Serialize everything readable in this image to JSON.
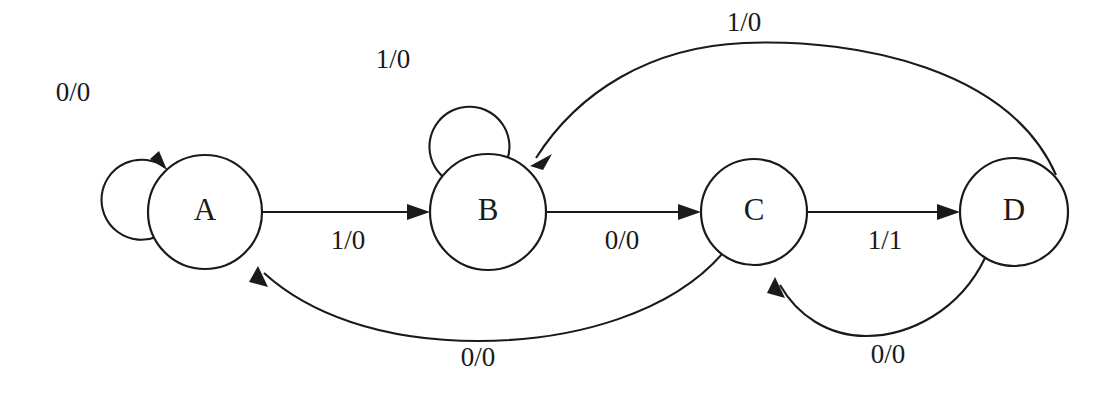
{
  "diagram": {
    "type": "finite-state-machine",
    "label_format": "input/output",
    "stroke_color": "#1a1a1a",
    "background_color": "#ffffff",
    "states": [
      {
        "id": "A",
        "label": "A",
        "cx": 205,
        "cy": 212,
        "r": 57
      },
      {
        "id": "B",
        "label": "B",
        "cx": 488,
        "cy": 212,
        "r": 58
      },
      {
        "id": "C",
        "label": "C",
        "cx": 754,
        "cy": 212,
        "r": 53
      },
      {
        "id": "D",
        "label": "D",
        "cx": 1014,
        "cy": 212,
        "r": 54
      }
    ],
    "transitions": [
      {
        "id": "a-self",
        "from": "A",
        "to": "A",
        "label": "0/0",
        "label_x": 73,
        "label_y": 95,
        "kind": "self-loop"
      },
      {
        "id": "a-to-b",
        "from": "A",
        "to": "B",
        "label": "1/0",
        "label_x": 348,
        "label_y": 243,
        "kind": "straight"
      },
      {
        "id": "b-self",
        "from": "B",
        "to": "B",
        "label": "1/0",
        "label_x": 393,
        "label_y": 62,
        "kind": "self-loop"
      },
      {
        "id": "b-to-c",
        "from": "B",
        "to": "C",
        "label": "0/0",
        "label_x": 622,
        "label_y": 243,
        "kind": "straight"
      },
      {
        "id": "c-to-d",
        "from": "C",
        "to": "D",
        "label": "1/1",
        "label_x": 885,
        "label_y": 243,
        "kind": "straight"
      },
      {
        "id": "d-to-b",
        "from": "D",
        "to": "B",
        "label": "1/0",
        "label_x": 744,
        "label_y": 25,
        "kind": "arc-top"
      },
      {
        "id": "c-to-a",
        "from": "C",
        "to": "A",
        "label": "0/0",
        "label_x": 478,
        "label_y": 360,
        "kind": "arc-bottom"
      },
      {
        "id": "d-to-c",
        "from": "D",
        "to": "C",
        "label": "0/0",
        "label_x": 888,
        "label_y": 357,
        "kind": "arc-bottom"
      }
    ]
  }
}
